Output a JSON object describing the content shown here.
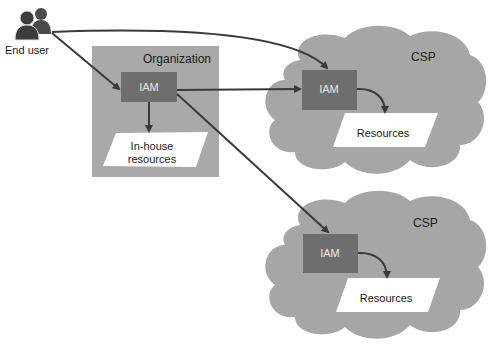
{
  "end_user": {
    "label": "End user",
    "icon": "users-icon"
  },
  "organization": {
    "label": "Organization",
    "iam_label": "IAM",
    "resources_label_line1": "In-house",
    "resources_label_line2": "resources"
  },
  "csp_clouds": [
    {
      "label": "CSP",
      "iam_label": "IAM",
      "resources_label": "Resources"
    },
    {
      "label": "CSP",
      "iam_label": "IAM",
      "resources_label": "Resources"
    }
  ],
  "colors": {
    "cloud_fill": "#a6a6a6",
    "org_fill": "#a9a9a9",
    "iam_fill": "#6e6e6e",
    "arrow": "#3a3a3a",
    "resource_fill": "#ffffff"
  }
}
